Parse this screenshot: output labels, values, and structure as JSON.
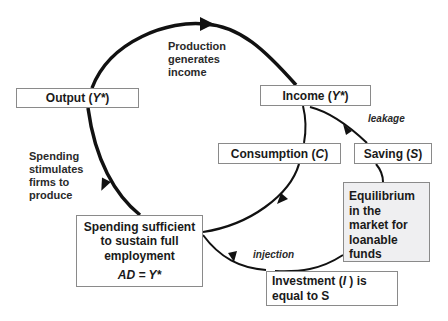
{
  "diagram": {
    "boxes": {
      "output": {
        "text": "Output (",
        "var": "Y*",
        "close": " )"
      },
      "income": {
        "text": "Income (",
        "var": "Y*",
        "close": " )"
      },
      "consumption": {
        "text": "Consumption (",
        "var": "C",
        "close": " )"
      },
      "saving": {
        "text": "Saving (",
        "var": "S",
        "close": " )"
      },
      "equilibrium": {
        "lines": [
          "Equilibrium",
          "in the",
          "market for",
          "loanable",
          "funds"
        ]
      },
      "spending": {
        "lines": [
          "Spending sufficient",
          "to sustain full",
          "employment"
        ],
        "equation": "AD = Y*"
      },
      "investment": {
        "line1_pre": "Investment (",
        "line1_var": "I",
        "line1_post": " ) is",
        "line2": "equal to S"
      }
    },
    "labels": {
      "production": [
        "Production",
        "generates",
        "income"
      ],
      "spending_stimulates": [
        "Spending",
        "stimulates",
        "firms to",
        "produce"
      ],
      "leakage": "leakage",
      "injection": "injection"
    },
    "colors": {
      "line": "#111111",
      "box_border": "#8a8a8a",
      "equilibrium_fill": "#efeff1"
    }
  }
}
